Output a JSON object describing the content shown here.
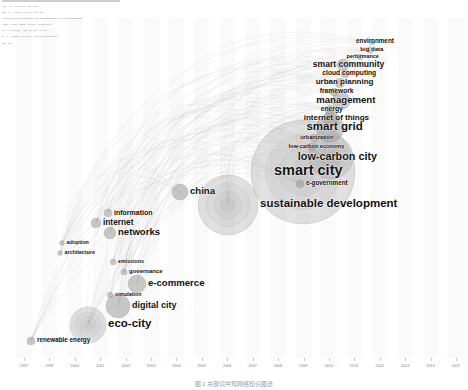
{
  "meta_block": {
    "bar_present": true,
    "lines": [
      "nnn  v. 5.8 R12 (64-bit)",
      "Apr 17, 2019 5:26:35 AM CST",
      "vvvvvvvvprocess/2018-10-30/2020/0111/11/11/DDDDdata",
      "Type: 1997-2018 (Slice Length=1)",
      "Nn =Pruning: Top 50 per slice",
      "h. c = NONE, G-N(1) (density=0.0031)",
      "Ng: MST"
    ]
  },
  "chart_data": {
    "type": "scatter",
    "xlabel": "",
    "ylabel": "",
    "grid": false,
    "legend": "none",
    "xlim": [
      1997,
      2018
    ],
    "x_ticks": [
      "1997",
      "1999",
      "2000",
      "2001",
      "2002",
      "2003",
      "2004",
      "2005",
      "2006",
      "2007",
      "2008",
      "2009",
      "2010",
      "2011",
      "2012",
      "2013",
      "2014",
      "2015"
    ],
    "nodes": [
      {
        "label": "renewable energy",
        "x": 31,
        "y": 341,
        "r": 4,
        "size": 6.3,
        "weight": "bold"
      },
      {
        "label": "eco-city",
        "x": 88,
        "y": 325,
        "r": 18,
        "size": 11.5,
        "weight": "bold"
      },
      {
        "label": "digital city",
        "x": 118,
        "y": 306,
        "r": 12,
        "size": 9.0,
        "weight": "bold"
      },
      {
        "label": "simulation",
        "x": 110,
        "y": 295,
        "r": 3,
        "size": 5.3,
        "weight": "bold"
      },
      {
        "label": "e-commerce",
        "x": 137,
        "y": 284,
        "r": 9,
        "size": 9.6,
        "weight": "bold"
      },
      {
        "label": "governance",
        "x": 124,
        "y": 272,
        "r": 3,
        "size": 6.0,
        "weight": "bold"
      },
      {
        "label": "emissions",
        "x": 113,
        "y": 262,
        "r": 3,
        "size": 5.3,
        "weight": "bold"
      },
      {
        "label": "architecture",
        "x": 60,
        "y": 253,
        "r": 2.5,
        "size": 5.3,
        "weight": "bold"
      },
      {
        "label": "adoption",
        "x": 62,
        "y": 243,
        "r": 2.5,
        "size": 5.3,
        "weight": "bold"
      },
      {
        "label": "networks",
        "x": 110,
        "y": 233,
        "r": 6,
        "size": 9.6,
        "weight": "bold"
      },
      {
        "label": "internet",
        "x": 96,
        "y": 223,
        "r": 5,
        "size": 8.3,
        "weight": "bold"
      },
      {
        "label": "information",
        "x": 108,
        "y": 213,
        "r": 4,
        "size": 7.0,
        "weight": "bold"
      },
      {
        "label": "sustainable development",
        "x": 228,
        "y": 205,
        "r": 30,
        "size": 11.5,
        "weight": "bold"
      },
      {
        "label": "china",
        "x": 180,
        "y": 192,
        "r": 8,
        "size": 9.6,
        "weight": "bold"
      },
      {
        "label": "e-government",
        "x": 300,
        "y": 184,
        "r": 4,
        "size": 6.3,
        "weight": "bold"
      },
      {
        "label": "smart city",
        "x": 303,
        "y": 172,
        "r": 52,
        "size": 14.5,
        "weight": "bold"
      },
      {
        "label": "low-carbon city",
        "x": 331,
        "y": 157,
        "r": 22,
        "size": 10.8,
        "weight": "bold"
      },
      {
        "label": "low-carbon economy",
        "x": 312,
        "y": 147,
        "r": 4,
        "size": 5.6,
        "weight": "bold"
      },
      {
        "label": "urbanization",
        "x": 314,
        "y": 138,
        "r": 4,
        "size": 5.6,
        "weight": "bold"
      },
      {
        "label": "smart grid",
        "x": 330,
        "y": 128,
        "r": 14,
        "size": 11.5,
        "weight": "bold"
      },
      {
        "label": "internet of things",
        "x": 331,
        "y": 119,
        "r": 8,
        "size": 8.0,
        "weight": "bold"
      },
      {
        "label": "energy",
        "x": 330,
        "y": 110,
        "r": 5,
        "size": 6.7,
        "weight": "bold"
      },
      {
        "label": "management",
        "x": 341,
        "y": 101,
        "r": 9,
        "size": 9.6,
        "weight": "bold"
      },
      {
        "label": "framework",
        "x": 334,
        "y": 92,
        "r": 4,
        "size": 6.7,
        "weight": "bold"
      },
      {
        "label": "urban planning",
        "x": 340,
        "y": 83,
        "r": 5,
        "size": 8.0,
        "weight": "bold"
      },
      {
        "label": "cloud computing",
        "x": 345,
        "y": 74,
        "r": 4,
        "size": 6.7,
        "weight": "bold"
      },
      {
        "label": "smart community",
        "x": 343,
        "y": 65,
        "r": 6,
        "size": 8.6,
        "weight": "bold"
      },
      {
        "label": "performance",
        "x": 360,
        "y": 57,
        "r": 3,
        "size": 5.3,
        "weight": "bold"
      },
      {
        "label": "big data",
        "x": 370,
        "y": 50,
        "r": 3.5,
        "size": 6.0,
        "weight": "bold"
      },
      {
        "label": "environment",
        "x": 372,
        "y": 42,
        "r": 3,
        "size": 6.3,
        "weight": "bold"
      }
    ]
  },
  "caption": {
    "text": "图 2  关键词共现网络知识图谱"
  },
  "colors": {
    "node_fill": "#9a9a9a",
    "edge": "#b4b4b4",
    "label": "#111111",
    "band": "#fafafa",
    "tick": "#7a7a7a"
  }
}
